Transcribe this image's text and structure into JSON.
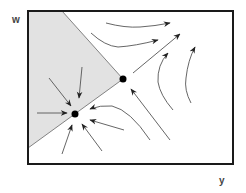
{
  "diagram": {
    "type": "phase-portrait",
    "axes": {
      "vertical_label": "w",
      "horizontal_label": "y"
    },
    "colors": {
      "frame": "#1a1a1a",
      "shaded_region": "#e2e2e2",
      "trajectory": "#555555",
      "fixed_point": "#000000",
      "background": "#ffffff"
    },
    "fixed_points": [
      {
        "name": "stable-node",
        "x": 75,
        "y": 114
      },
      {
        "name": "saddle-point",
        "x": 123,
        "y": 79
      }
    ],
    "shaded_region": {
      "description": "basin of attraction bounded by separatrices through saddle point",
      "vertices": [
        [
          28,
          11
        ],
        [
          62,
          11
        ],
        [
          123,
          79
        ],
        [
          28,
          148
        ]
      ]
    }
  }
}
